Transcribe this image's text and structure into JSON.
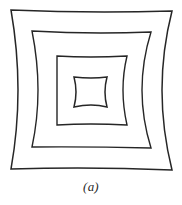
{
  "figure": {
    "caption": "(a)",
    "background_color": "#ffffff",
    "stroke_color": "#262626",
    "width": 182,
    "height": 205,
    "squares": [
      {
        "name": "outer-square",
        "index": 1,
        "corners": [
          [
            11,
            10
          ],
          [
            172,
            11
          ],
          [
            172,
            170
          ],
          [
            11,
            169
          ]
        ],
        "edge_midpoints": [
          [
            91,
            12
          ],
          [
            162,
            90
          ],
          [
            91,
            168
          ],
          [
            18,
            90
          ]
        ],
        "stroke_width": 1.5,
        "bow_depth_px": 8
      },
      {
        "name": "second-square",
        "index": 2,
        "corners": [
          [
            32,
            31
          ],
          [
            151,
            32
          ],
          [
            151,
            148
          ],
          [
            32,
            147
          ]
        ],
        "edge_midpoints": [
          [
            91,
            33
          ],
          [
            142,
            90
          ],
          [
            91,
            147
          ],
          [
            38,
            90
          ]
        ],
        "stroke_width": 1.4,
        "bow_depth_px": 6
      },
      {
        "name": "third-square",
        "index": 3,
        "corners": [
          [
            57,
            56
          ],
          [
            127,
            56
          ],
          [
            127,
            125
          ],
          [
            57,
            125
          ]
        ],
        "edge_midpoints": [
          [
            91,
            57
          ],
          [
            123,
            90
          ],
          [
            91,
            124
          ],
          [
            57,
            90
          ]
        ],
        "stroke_width": 1.4,
        "bow_depth_px": 4
      },
      {
        "name": "inner-square",
        "index": 4,
        "corners": [
          [
            74,
            77
          ],
          [
            107,
            77
          ],
          [
            107,
            107
          ],
          [
            74,
            107
          ]
        ],
        "edge_midpoints": [
          [
            91,
            78
          ],
          [
            105,
            92
          ],
          [
            91,
            105
          ],
          [
            76,
            92
          ]
        ],
        "stroke_width": 1.5,
        "bow_depth_px": 2
      }
    ]
  }
}
